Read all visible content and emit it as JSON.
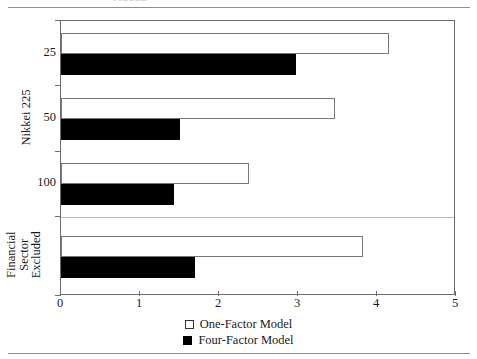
{
  "figure": {
    "clipped_caption": "FIGURE",
    "axis_color": "#6d6d6d",
    "rule_color": "#8d8d8d"
  },
  "legend": {
    "position": "bottom-center",
    "entries": [
      {
        "label": "One-Factor Model",
        "swatch": "hollow-square",
        "color": "#ffffff"
      },
      {
        "label": "Four-Factor Model",
        "swatch": "filled-square",
        "color": "#000000"
      }
    ]
  },
  "axes": {
    "x": {
      "ticks": [
        "0",
        "1",
        "2",
        "3",
        "4",
        "5"
      ],
      "min": 0,
      "max": 5,
      "label": ""
    },
    "y": {
      "group_labels": [
        "Nikkei 225",
        "Financial\nSector\nExcluded"
      ],
      "group_label_nikkei": "Nikkei 225",
      "group_label_financial_line1": "Financial",
      "group_label_financial_line2": "Sector",
      "group_label_financial_line3": "Excluded",
      "ticks": [
        "25",
        "50",
        "100"
      ]
    }
  },
  "chart_data": {
    "type": "bar",
    "orientation": "horizontal",
    "title": "",
    "subtitle": "",
    "xlabel": "",
    "ylabel": "",
    "xlim": [
      0,
      5
    ],
    "grid": false,
    "legend_position": "bottom-center",
    "categories": [
      "25",
      "50",
      "100",
      "Financial Sector Excluded"
    ],
    "category_groups": [
      "Nikkei 225",
      "Nikkei 225",
      "Nikkei 225",
      "Financial Sector Excluded"
    ],
    "series": [
      {
        "name": "One-Factor Model",
        "color": "#ffffff",
        "values": [
          4.15,
          3.47,
          2.38,
          3.82
        ]
      },
      {
        "name": "Four-Factor Model",
        "color": "#000000",
        "values": [
          2.97,
          1.51,
          1.43,
          1.7
        ]
      }
    ],
    "xticks": [
      0,
      1,
      2,
      3,
      4,
      5
    ]
  }
}
